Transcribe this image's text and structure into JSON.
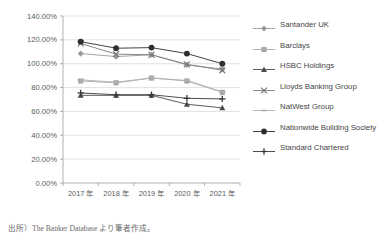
{
  "chart_data": {
    "type": "line",
    "title": "",
    "xlabel": "",
    "ylabel": "",
    "categories": [
      "2017 年",
      "2018 年",
      "2019 年",
      "2020 年",
      "2021 年"
    ],
    "x_tick_labels": [
      "2017 年",
      "2018 年",
      "2019 年",
      "2020 年",
      "2021 年"
    ],
    "y_tick_labels": [
      "0.00%",
      "20.00%",
      "40.00%",
      "60.00%",
      "80.00%",
      "100.00%",
      "120.00%",
      "140.00%"
    ],
    "y_tick_values": [
      0,
      20,
      40,
      60,
      80,
      100,
      120,
      140
    ],
    "ylim": [
      0,
      140
    ],
    "grid": "horizontal",
    "legend_position": "right",
    "series": [
      {
        "name": "Santander UK",
        "marker": "diamond",
        "color": "#9a9a9a",
        "values": [
          108.5,
          106.0,
          107.5,
          99.0,
          95.5
        ]
      },
      {
        "name": "Barclays",
        "marker": "square",
        "color": "#a8a8a8",
        "values": [
          85.5,
          84.0,
          88.0,
          85.5,
          76.0
        ]
      },
      {
        "name": "HSBC Holdings",
        "marker": "triangle",
        "color": "#4a4a4a",
        "values": [
          73.5,
          73.5,
          73.5,
          66.0,
          63.0
        ]
      },
      {
        "name": "Lloyds Banking Group",
        "marker": "x",
        "color": "#7c7c7c",
        "values": [
          117.0,
          108.0,
          107.5,
          99.5,
          94.5
        ]
      },
      {
        "name": "NatWest Group",
        "marker": "dash",
        "color": "#b0b0b0",
        "values": [
          86.5,
          84.5,
          88.0,
          86.0,
          76.5
        ]
      },
      {
        "name": "Nationwide Building Society",
        "marker": "circle",
        "color": "#2e2e2e",
        "values": [
          118.5,
          113.0,
          113.5,
          108.5,
          100.0
        ]
      },
      {
        "name": "Standard Chartered",
        "marker": "plus",
        "color": "#3a3a3a",
        "values": [
          75.5,
          74.0,
          74.0,
          71.0,
          70.5
        ]
      }
    ]
  },
  "legend": {
    "items": [
      "Santander UK",
      "Barclays",
      "HSBC Holdings",
      "Lloyds Banking Group",
      "NatWest Group",
      "Nationwide Building Society",
      "Standard Chartered"
    ]
  },
  "source_note": "出所）The Banker Database より筆者作成。"
}
